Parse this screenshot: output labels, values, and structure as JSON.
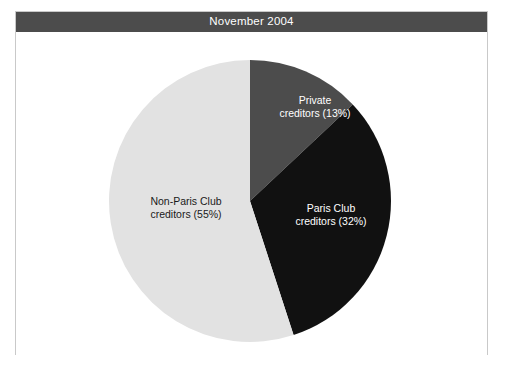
{
  "figure": {
    "title": "November 2004",
    "frame_border_color": "#c9c9c9",
    "title_bar_color": "#4c4c4c",
    "title_text_color": "#ffffff",
    "background_color": "#ffffff"
  },
  "chart_data": {
    "type": "pie",
    "title": "November 2004",
    "xlabel": "",
    "ylabel": "",
    "legend": "none",
    "grid": false,
    "start_angle_deg": 0,
    "direction": "clockwise",
    "categories": [
      "Private creditors",
      "Paris Club creditors",
      "Non-Paris Club creditors"
    ],
    "values": [
      13,
      32,
      55
    ],
    "units": "percent",
    "slices": [
      {
        "name": "Private creditors",
        "value": 13,
        "label": "Private creditors (13%)",
        "label_line_1": "Private",
        "label_line_2": "creditors (13%)",
        "color": "#4c4c4c",
        "label_color": "#ffffff"
      },
      {
        "name": "Paris Club creditors",
        "value": 32,
        "label": "Paris Club creditors (32%)",
        "label_line_1": "Paris Club",
        "label_line_2": "creditors (32%)",
        "color": "#111111",
        "label_color": "#ffffff"
      },
      {
        "name": "Non-Paris Club creditors",
        "value": 55,
        "label": "Non-Paris Club creditors (55%)",
        "label_line_1": "Non-Paris Club",
        "label_line_2": "creditors (55%)",
        "color": "#e2e2e2",
        "label_color": "#1a1a1a"
      }
    ]
  }
}
